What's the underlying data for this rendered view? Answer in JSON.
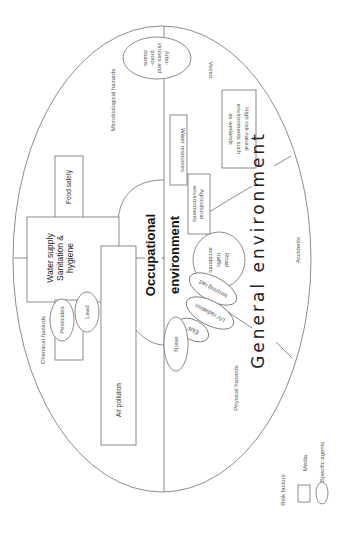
{
  "diagram": {
    "orientation": "rotated 90 degrees counter-clockwise",
    "regions": {
      "general_environment": "General environment",
      "occupational_environment_line1": "Occupational",
      "occupational_environment_line2": "environment"
    },
    "quadrant_labels": {
      "microbiological": "Microbiological hazards",
      "vector": "Vector",
      "chemical": "Chemical hazards",
      "physical": "Physical hazards",
      "accidents": "Accidents"
    },
    "media": {
      "water_supply_line1": "Water supply",
      "water_supply_line2": "Sanitation &",
      "water_supply_line3": "hygiene",
      "food_safety": "Food safety",
      "air_pollution": "Air pollution",
      "water_resources": "Water resources",
      "agricultural_line1": "Agricultural",
      "agricultural_line2": "environments",
      "high_risk_line1": "High risk natural",
      "high_risk_line2": "environments such",
      "high_risk_line3": "as wetlands"
    },
    "agents": {
      "arbo_line1": "Arbo-",
      "arbo_line2": "viruses and",
      "arbo_line3": "proto-",
      "arbo_line4": "zoans",
      "pesticides": "Pesticides",
      "lead": "Lead",
      "road_line1": "Road",
      "road_line2": "traffic",
      "road_line3": "accidents",
      "ionizing": "Ionizing rad",
      "uv": "UV radiation",
      "emf": "EMF",
      "noise": "Noise"
    },
    "legend": {
      "title": "Risk factors",
      "media": "Media",
      "specific_agents": "Specific agents"
    },
    "colors": {
      "line": "#6e6e6e",
      "text": "#555555",
      "background": "#ffffff"
    }
  }
}
